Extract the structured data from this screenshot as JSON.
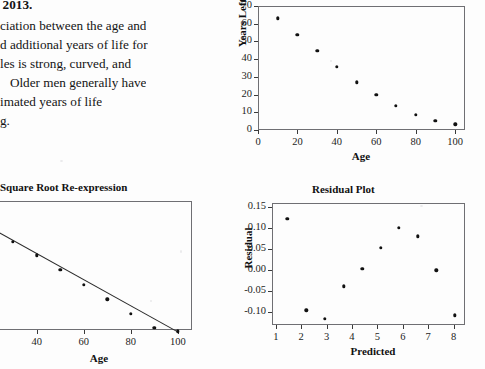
{
  "document": {
    "paragraph_lines": [
      ", 2013.",
      "ciation between the age and",
      "d additional years of life for",
      "les is strong, curved, and",
      "   Older men generally have",
      "imated years of life",
      "g."
    ]
  },
  "chart_data": [
    {
      "id": "scatter-age-years-left",
      "type": "scatter",
      "title": "",
      "xlabel": "Age",
      "ylabel": "Years Left",
      "xlim": [
        0,
        105
      ],
      "ylim": [
        0,
        70
      ],
      "xticks": [
        0,
        20,
        40,
        60,
        80,
        100
      ],
      "yticks": [
        0,
        10,
        20,
        30,
        40,
        50,
        60,
        70
      ],
      "grid": false,
      "legend": "none",
      "x": [
        10,
        20,
        30,
        40,
        50,
        60,
        70,
        80,
        90,
        100
      ],
      "y": [
        63.0,
        53.8,
        44.8,
        35.6,
        27.0,
        19.8,
        13.7,
        8.7,
        5.2,
        3.3
      ]
    },
    {
      "id": "sqrt-re-expression",
      "type": "scatter",
      "title": "Square Root Re-expression",
      "xlabel": "Age",
      "ylabel": "",
      "xlim": [
        10,
        106
      ],
      "ylim": [
        3.0,
        8.4
      ],
      "xticks": [
        20,
        40,
        60,
        80,
        100
      ],
      "yticks": [],
      "grid": false,
      "legend": "none",
      "has_fit_line": true,
      "x": [
        20,
        30,
        40,
        50,
        60,
        70,
        80,
        90,
        100
      ],
      "y": [
        7.33,
        6.7,
        6.12,
        5.52,
        4.89,
        4.28,
        3.68,
        3.1,
        2.95
      ]
    },
    {
      "id": "residual-plot",
      "type": "scatter",
      "title": "Residual Plot",
      "xlabel": "Predicted",
      "ylabel": "Residual",
      "xlim": [
        0.85,
        8.45
      ],
      "ylim": [
        -0.13,
        0.16
      ],
      "xticks": [
        1,
        2,
        3,
        4,
        5,
        6,
        7,
        8
      ],
      "yticks": [
        -0.1,
        -0.05,
        0.0,
        0.05,
        0.1,
        0.15
      ],
      "ytick_labels": [
        "-0.10",
        "-0.05",
        "0.00",
        "0.05",
        "0.10",
        "0.15"
      ],
      "grid": false,
      "legend": "none",
      "x": [
        1.45,
        2.2,
        2.93,
        3.67,
        4.4,
        5.13,
        5.85,
        6.58,
        7.32,
        8.05
      ],
      "y": [
        0.122,
        -0.095,
        -0.115,
        -0.038,
        0.003,
        0.054,
        0.101,
        0.081,
        0.0,
        -0.107
      ]
    }
  ],
  "colors": {
    "ink": "#111111",
    "frame": "#6f6f73",
    "page_background": "#fdfdfd"
  }
}
